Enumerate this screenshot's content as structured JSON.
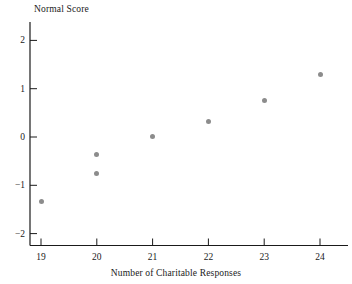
{
  "chart_data": {
    "type": "scatter",
    "title": "",
    "xlabel": "Number of Charitable Responses",
    "ylabel": "Normal Score",
    "xlim": [
      18.5,
      24.5
    ],
    "ylim": [
      -2.25,
      2.25
    ],
    "xticks": [
      19,
      20,
      21,
      22,
      23,
      24
    ],
    "yticks": [
      2,
      1,
      0,
      -1,
      -2
    ],
    "xtick_labels": [
      "19",
      "20",
      "21",
      "22",
      "23",
      "24"
    ],
    "ytick_labels": [
      "2",
      "1",
      "0",
      "−1",
      "−2"
    ],
    "grid": false,
    "legend": null,
    "marker_color": "#8c8c8c",
    "axis_color": "#1a1a1a",
    "points": [
      {
        "x": 19,
        "y": -1.33
      },
      {
        "x": 20,
        "y": -0.75
      },
      {
        "x": 20,
        "y": -0.37
      },
      {
        "x": 21,
        "y": 0.02
      },
      {
        "x": 22,
        "y": 0.33
      },
      {
        "x": 23,
        "y": 0.75
      },
      {
        "x": 24,
        "y": 1.3
      }
    ]
  }
}
